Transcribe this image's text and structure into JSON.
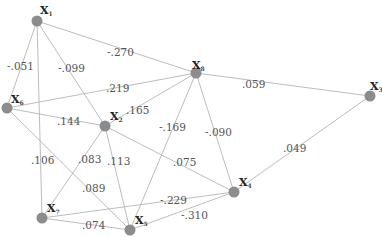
{
  "diagram": {
    "type": "network-graph",
    "nodes": [
      {
        "id": "X1",
        "label": "X",
        "sub": "1",
        "x": 37,
        "y": 21,
        "lx": 40,
        "ly": 14
      },
      {
        "id": "X8",
        "label": "X",
        "sub": "8",
        "x": 196,
        "y": 73,
        "lx": 192,
        "ly": 69
      },
      {
        "id": "X3",
        "label": "X",
        "sub": "3",
        "x": 370,
        "y": 96,
        "lx": 370,
        "ly": 90
      },
      {
        "id": "X6",
        "label": "X",
        "sub": "6",
        "x": 7,
        "y": 108,
        "lx": 11,
        "ly": 103
      },
      {
        "id": "X2",
        "label": "X",
        "sub": "2",
        "x": 105,
        "y": 126,
        "lx": 110,
        "ly": 120
      },
      {
        "id": "X4",
        "label": "X",
        "sub": "4",
        "x": 234,
        "y": 192,
        "lx": 239,
        "ly": 186
      },
      {
        "id": "X7",
        "label": "X",
        "sub": "7",
        "x": 42,
        "y": 218,
        "lx": 47,
        "ly": 212
      },
      {
        "id": "X5",
        "label": "X",
        "sub": "5",
        "x": 130,
        "y": 230,
        "lx": 135,
        "ly": 224
      }
    ],
    "edges": [
      {
        "from": "X1",
        "to": "X6",
        "weight": "-.051",
        "lx": 7,
        "ly": 70
      },
      {
        "from": "X1",
        "to": "X7",
        "weight": ".106",
        "lx": 31,
        "ly": 164
      },
      {
        "from": "X1",
        "to": "X2",
        "weight": "-.099",
        "lx": 58,
        "ly": 72
      },
      {
        "from": "X1",
        "to": "X8",
        "weight": "-.270",
        "lx": 107,
        "ly": 56
      },
      {
        "from": "X6",
        "to": "X8",
        "weight": ".219",
        "lx": 106,
        "ly": 92
      },
      {
        "from": "X6",
        "to": "X2",
        "weight": ".144",
        "lx": 57,
        "ly": 125
      },
      {
        "from": "X6",
        "to": "X5",
        "weight": ".089",
        "lx": 82,
        "ly": 192
      },
      {
        "from": "X2",
        "to": "X8",
        "weight": ".165",
        "lx": 126,
        "ly": 114
      },
      {
        "from": "X2",
        "to": "X7",
        "weight": ".083",
        "lx": 78,
        "ly": 163
      },
      {
        "from": "X2",
        "to": "X5",
        "weight": ".113",
        "lx": 107,
        "ly": 165
      },
      {
        "from": "X2",
        "to": "X4",
        "weight": ".075",
        "lx": 173,
        "ly": 166
      },
      {
        "from": "X8",
        "to": "X3",
        "weight": ".059",
        "lx": 242,
        "ly": 88
      },
      {
        "from": "X8",
        "to": "X5",
        "weight": "-.169",
        "lx": 159,
        "ly": 131
      },
      {
        "from": "X8",
        "to": "X4",
        "weight": "-.090",
        "lx": 205,
        "ly": 136
      },
      {
        "from": "X3",
        "to": "X4",
        "weight": ".049",
        "lx": 283,
        "ly": 152
      },
      {
        "from": "X7",
        "to": "X4",
        "weight": "-.229",
        "lx": 160,
        "ly": 204
      },
      {
        "from": "X7",
        "to": "X5",
        "weight": ".074",
        "lx": 82,
        "ly": 229
      },
      {
        "from": "X5",
        "to": "X4",
        "weight": "-.310",
        "lx": 181,
        "ly": 219
      }
    ]
  },
  "colors": {
    "edge": "#b4b4b4",
    "node": "#8c8c8c",
    "label": "#555555"
  }
}
